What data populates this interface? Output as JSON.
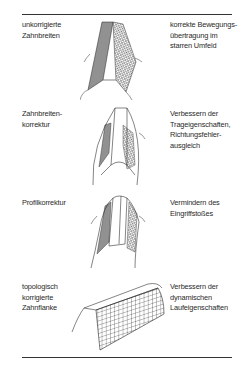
{
  "rows": [
    {
      "left": "unkorrigierte\nZahnbreiten",
      "right": "korrekte Bewegungs-\nübertragung im\nstarren Umfeld",
      "figure": "uncorrected-tooth-flank"
    },
    {
      "left": "Zahnbreiten-\nkorrektur",
      "right": "Verbessern der\nTrageigenschaften,\nRichtungsfehler-\nausgleich",
      "figure": "crowned-tooth-flank"
    },
    {
      "left": "Profilkorrektur",
      "right": "Vermindern des\nEingriffstoßes",
      "figure": "profile-corrected-tooth-flank"
    },
    {
      "left": "topologisch\nkorrigierte\nZahnflanke",
      "right": "Verbessern der\ndynamischen\nLaufeigenschaften",
      "figure": "topologically-corrected-tooth-flank"
    }
  ],
  "colors": {
    "line": "#333333",
    "text": "#2a2a2a",
    "background": "#ffffff"
  }
}
